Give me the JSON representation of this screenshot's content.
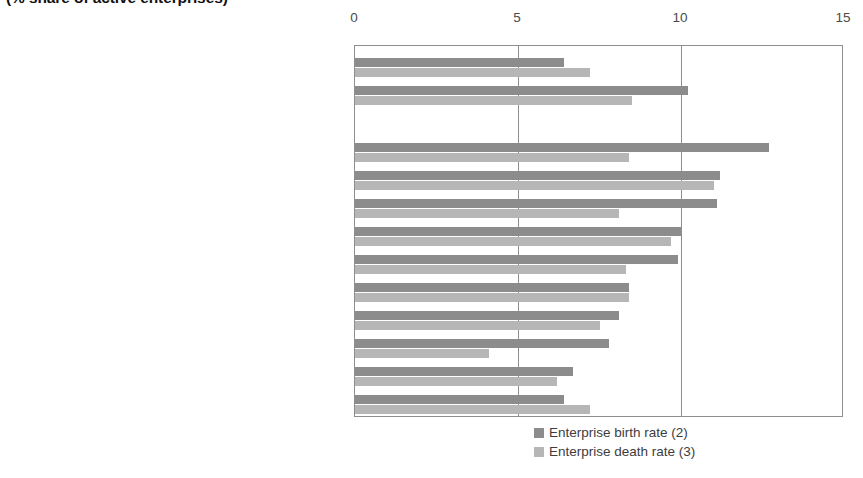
{
  "chart_data": {
    "type": "bar",
    "orientation": "horizontal",
    "title": "(% share of active enterprises)",
    "xlabel": "",
    "ylabel": "",
    "xlim": [
      0,
      15
    ],
    "xticks": [
      0,
      5,
      10,
      15
    ],
    "xtick_labels": [
      "0",
      "5",
      "10",
      "15"
    ],
    "grid": true,
    "legend_position": "bottom-right",
    "categories": [
      "Industry",
      "Services (1)",
      "",
      "Real estate, renting and business activities (1)",
      "Financial intermediation",
      "Construction",
      "Hotels & restaurants",
      "Business economy (1)",
      "Distributive trades",
      "Transport & communications",
      "Electricity, gas and water supply",
      "Mining & quarrying",
      "Manufacturing"
    ],
    "series": [
      {
        "name": "Enterprise birth rate (2)",
        "color": "#8c8c8c",
        "values": [
          6.4,
          10.2,
          null,
          12.7,
          11.2,
          11.1,
          10.0,
          9.9,
          8.4,
          8.1,
          7.8,
          6.7,
          6.4
        ]
      },
      {
        "name": "Enterprise death rate (3)",
        "color": "#b6b6b6",
        "values": [
          7.2,
          8.5,
          null,
          8.4,
          11.0,
          8.1,
          9.7,
          8.3,
          8.4,
          7.5,
          4.1,
          6.2,
          7.2
        ]
      }
    ]
  },
  "legend": {
    "entries": [
      {
        "label": "Enterprise birth rate (2)",
        "color": "#8c8c8c"
      },
      {
        "label": "Enterprise death rate (3)",
        "color": "#b6b6b6"
      }
    ]
  }
}
